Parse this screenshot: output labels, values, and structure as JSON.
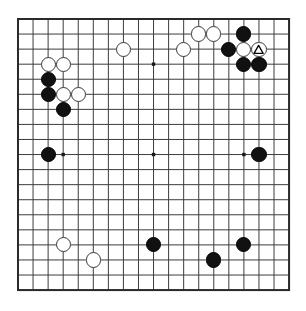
{
  "app": {
    "title": "Go Board Diagram",
    "type": "go-game-board"
  },
  "board": {
    "size": 19,
    "label": "19x19 Go board",
    "line_color": "#3c3c3c",
    "border_color": "#2a2a2a",
    "background_color": "#ffffff",
    "star_point_color": "#1a1a1a",
    "black_stone_color": "#111111",
    "white_stone_color": "#ffffff",
    "white_stone_border_color": "#3a3a3a",
    "geometry": {
      "origin_x": 18,
      "origin_y": 19,
      "spacing": 15.06,
      "stone_radius": 7.6,
      "line_width": 1,
      "border_width": 2
    },
    "star_points": [
      {
        "col": 3,
        "row": 3
      },
      {
        "col": 9,
        "row": 3
      },
      {
        "col": 15,
        "row": 3
      },
      {
        "col": 3,
        "row": 9
      },
      {
        "col": 9,
        "row": 9
      },
      {
        "col": 15,
        "row": 9
      },
      {
        "col": 3,
        "row": 15
      },
      {
        "col": 9,
        "row": 15
      },
      {
        "col": 15,
        "row": 15
      }
    ]
  },
  "stones": [
    {
      "color": "white",
      "col": 12,
      "row": 1,
      "marker": "none"
    },
    {
      "color": "white",
      "col": 13,
      "row": 1,
      "marker": "none"
    },
    {
      "color": "black",
      "col": 15,
      "row": 1,
      "marker": "none"
    },
    {
      "color": "white",
      "col": 7,
      "row": 2,
      "marker": "none"
    },
    {
      "color": "white",
      "col": 11,
      "row": 2,
      "marker": "none"
    },
    {
      "color": "black",
      "col": 14,
      "row": 2,
      "marker": "none"
    },
    {
      "color": "white",
      "col": 15,
      "row": 2,
      "marker": "none"
    },
    {
      "color": "white",
      "col": 16,
      "row": 2,
      "marker": "triangle"
    },
    {
      "color": "white",
      "col": 2,
      "row": 3,
      "marker": "none"
    },
    {
      "color": "white",
      "col": 3,
      "row": 3,
      "marker": "none"
    },
    {
      "color": "black",
      "col": 15,
      "row": 3,
      "marker": "none"
    },
    {
      "color": "black",
      "col": 16,
      "row": 3,
      "marker": "none"
    },
    {
      "color": "black",
      "col": 2,
      "row": 4,
      "marker": "none"
    },
    {
      "color": "black",
      "col": 2,
      "row": 5,
      "marker": "none"
    },
    {
      "color": "white",
      "col": 3,
      "row": 5,
      "marker": "none"
    },
    {
      "color": "white",
      "col": 4,
      "row": 5,
      "marker": "none"
    },
    {
      "color": "black",
      "col": 3,
      "row": 6,
      "marker": "none"
    },
    {
      "color": "black",
      "col": 2,
      "row": 9,
      "marker": "none"
    },
    {
      "color": "black",
      "col": 16,
      "row": 9,
      "marker": "none"
    },
    {
      "color": "white",
      "col": 3,
      "row": 15,
      "marker": "none"
    },
    {
      "color": "black",
      "col": 9,
      "row": 15,
      "marker": "none"
    },
    {
      "color": "black",
      "col": 15,
      "row": 15,
      "marker": "none"
    },
    {
      "color": "white",
      "col": 5,
      "row": 16,
      "marker": "none"
    },
    {
      "color": "black",
      "col": 13,
      "row": 16,
      "marker": "none"
    }
  ]
}
